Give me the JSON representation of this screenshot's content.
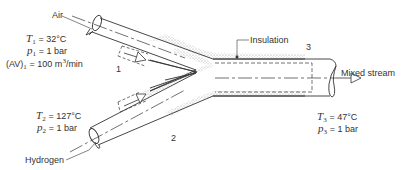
{
  "labels": {
    "air": "Air",
    "hydrogen": "Hydrogen",
    "insulation": "Insulation",
    "mixed_stream": "Mixed stream"
  },
  "state_numbers": {
    "inlet1": "1",
    "inlet2": "2",
    "outlet3": "3"
  },
  "inlet1": {
    "T_symbol": "T",
    "T_sub": "1",
    "T_value": "= 32°C",
    "p_symbol": "p",
    "p_sub": "1",
    "p_value": "= 1 bar",
    "AV_symbol": "(AV)",
    "AV_sub": "1",
    "AV_value": "= 100 m",
    "AV_unit_sup": "3",
    "AV_unit_tail": "/min"
  },
  "inlet2": {
    "T_symbol": "T",
    "T_sub": "2",
    "T_value": "= 127°C",
    "p_symbol": "p",
    "p_sub": "2",
    "p_value": "= 1 bar"
  },
  "outlet3": {
    "T_symbol": "T",
    "T_sub": "3",
    "T_value": "= 47°C",
    "p_symbol": "p",
    "p_sub": "3",
    "p_value": "= 1 bar"
  },
  "colors": {
    "line": "#333333",
    "insulation": "#b8b8b8",
    "background": "#ffffff"
  }
}
